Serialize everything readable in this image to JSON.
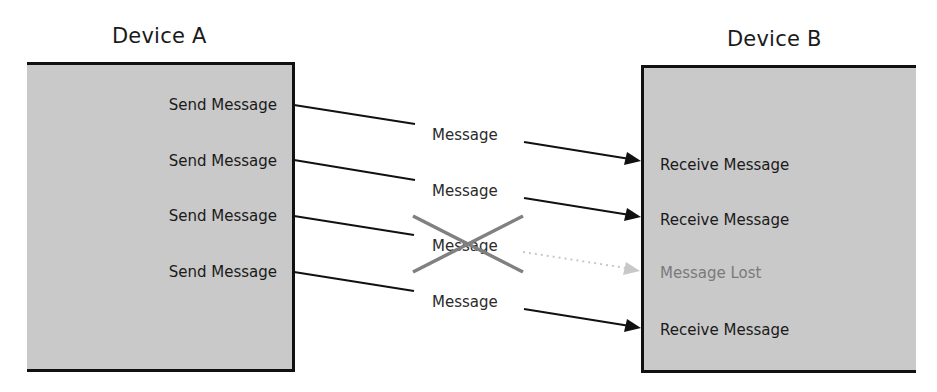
{
  "diagram": {
    "device_a": {
      "title": "Device A",
      "actions": [
        "Send Message",
        "Send Message",
        "Send Message",
        "Send Message"
      ]
    },
    "device_b": {
      "title": "Device B",
      "results": [
        {
          "label": "Receive Message",
          "status": "received"
        },
        {
          "label": "Receive Message",
          "status": "received"
        },
        {
          "label": "Message Lost",
          "status": "lost"
        },
        {
          "label": "Receive Message",
          "status": "received"
        }
      ]
    },
    "messages": [
      {
        "label": "Message",
        "delivered": true
      },
      {
        "label": "Message",
        "delivered": true
      },
      {
        "label": "Message",
        "delivered": false
      },
      {
        "label": "Message",
        "delivered": true
      }
    ],
    "colors": {
      "box_fill": "#c9c9c9",
      "line": "#111111",
      "cross": "#808080",
      "lost_path": "#c8c8c8",
      "lost_text": "#7a7a7a"
    }
  }
}
